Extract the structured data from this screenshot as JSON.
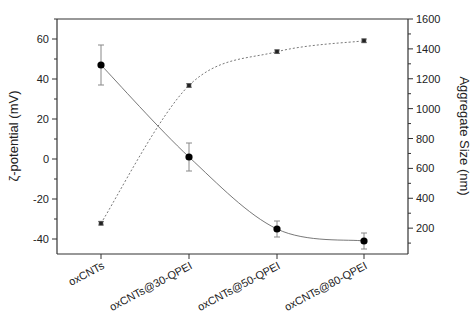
{
  "chart_data": {
    "type": "line",
    "title": "",
    "categories": [
      "oxCNTs",
      "oxCNTs@30-QPEI",
      "oxCNTs@50-QPEI",
      "oxCNTs@80-QPEI"
    ],
    "xlabel": "",
    "y_left": {
      "label": "ζ-potential (mV)",
      "range": [
        -47.5,
        70
      ],
      "ticks": [
        -40,
        -20,
        0,
        20,
        40,
        60
      ],
      "tick_labels": [
        "-40",
        "-20",
        "0",
        "20",
        "40",
        "60"
      ],
      "minor_step": 10
    },
    "y_right": {
      "label": "Aggregate Size (nm)",
      "range": [
        27,
        1600
      ],
      "ticks": [
        200,
        400,
        600,
        800,
        1000,
        1200,
        1400,
        1600
      ],
      "tick_labels": [
        "200",
        "400",
        "600",
        "800",
        "1000",
        "1200",
        "1400",
        "1600"
      ],
      "minor_step": 100
    },
    "series": [
      {
        "name": "ζ-potential",
        "axis": "left",
        "marker": "circle",
        "line": "solid",
        "values": [
          47,
          1,
          -35,
          -41
        ],
        "errors": [
          10,
          7,
          4,
          4
        ]
      },
      {
        "name": "Aggregate Size",
        "axis": "right",
        "marker": "square",
        "line": "dashed",
        "values": [
          233,
          1155,
          1381,
          1454
        ],
        "errors": [
          12,
          12,
          12,
          12
        ]
      }
    ],
    "grid": false,
    "legend": "none"
  }
}
